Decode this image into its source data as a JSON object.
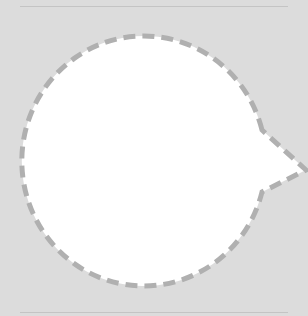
{
  "canvas": {
    "background": "#dcdcdc",
    "width": 308,
    "height": 316
  },
  "shape": {
    "type": "speech-bubble",
    "fill": "#ffffff",
    "stroke": "#b0b0b0",
    "stroke_style": "dashed",
    "tail_direction": "right",
    "text": ""
  },
  "rules": {
    "color": "#c4c4c4"
  }
}
